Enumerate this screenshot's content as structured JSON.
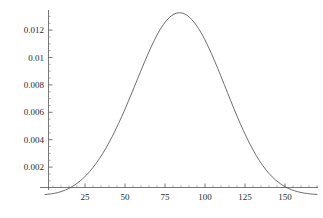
{
  "chart_data": {
    "type": "line",
    "title": "",
    "subtitle": "",
    "xlabel": "",
    "ylabel": "",
    "xlim": [
      -5,
      172
    ],
    "ylim": [
      0,
      0.0139
    ],
    "grid": false,
    "legend": null,
    "annotations": [],
    "x_ticks": [
      25,
      50,
      75,
      100,
      125,
      150
    ],
    "x_tick_labels": [
      "25",
      "50",
      "75",
      "100",
      "125",
      "150"
    ],
    "y_ticks": [
      0.002,
      0.004,
      0.006,
      0.008,
      0.01,
      0.012
    ],
    "y_tick_labels": [
      "0.002",
      "0.004",
      "0.006",
      "0.008",
      "0.01",
      "0.012"
    ],
    "x_minor_tick_interval": 5,
    "y_minor_tick_interval": 0.0005,
    "series": [
      {
        "name": "density",
        "color": "#4a4a4a",
        "line_width": 0.8,
        "x": [
          0,
          2,
          4,
          6,
          8,
          10,
          12,
          14,
          16,
          18,
          20,
          22,
          24,
          26,
          28,
          30,
          32,
          34,
          36,
          38,
          40,
          42,
          44,
          46,
          48,
          50,
          52,
          54,
          56,
          58,
          60,
          62,
          64,
          66,
          68,
          70,
          72,
          74,
          76,
          78,
          80,
          82,
          84,
          86,
          88,
          90,
          92,
          94,
          96,
          98,
          100,
          102,
          104,
          106,
          108,
          110,
          112,
          114,
          116,
          118,
          120,
          122,
          124,
          126,
          128,
          130,
          132,
          134,
          136,
          138,
          140,
          142,
          144,
          146,
          148,
          150,
          152,
          154,
          156,
          158,
          160,
          162,
          164,
          166,
          168,
          170
        ],
        "y": [
          0.0,
          2e-05,
          5e-05,
          9e-05,
          0.00014,
          0.00021,
          0.00029,
          0.00039,
          0.00051,
          0.00065,
          0.00081,
          0.00099,
          0.0012,
          0.00143,
          0.00169,
          0.00197,
          0.00228,
          0.00262,
          0.00298,
          0.00337,
          0.00379,
          0.00423,
          0.0047,
          0.00519,
          0.0057,
          0.00623,
          0.00678,
          0.00734,
          0.00791,
          0.00848,
          0.00905,
          0.00961,
          0.01016,
          0.01069,
          0.01118,
          0.01164,
          0.01205,
          0.01241,
          0.01271,
          0.01295,
          0.01313,
          0.01323,
          0.01327,
          0.01324,
          0.01314,
          0.01297,
          0.01274,
          0.01245,
          0.01211,
          0.01172,
          0.01128,
          0.0108,
          0.01029,
          0.00975,
          0.00919,
          0.00862,
          0.00804,
          0.00745,
          0.00687,
          0.00629,
          0.00573,
          0.00519,
          0.00467,
          0.00417,
          0.0037,
          0.00326,
          0.00285,
          0.00247,
          0.00213,
          0.00182,
          0.00154,
          0.00129,
          0.00107,
          0.00088,
          0.00071,
          0.00057,
          0.00045,
          0.00035,
          0.00027,
          0.0002,
          0.00015,
          0.0001,
          7e-05,
          4e-05,
          2e-05,
          0.0
        ]
      }
    ],
    "peak": {
      "x": 80,
      "y": 0.0133
    },
    "axis_color": "#555555",
    "background_color": "#ffffff"
  }
}
